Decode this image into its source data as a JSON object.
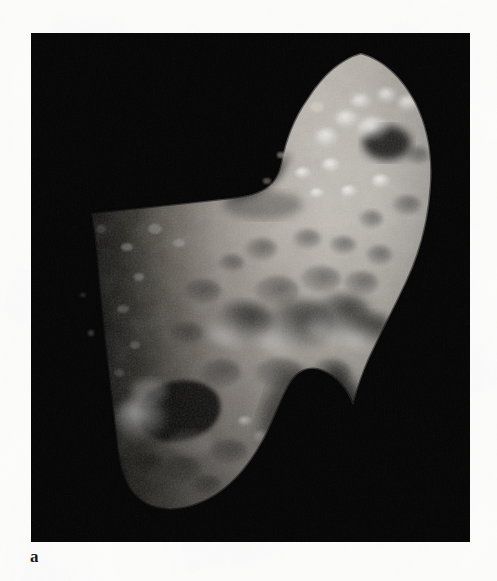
{
  "figure": {
    "panel_label": "a",
    "background_color": "#050505",
    "page_color": "#fbfbfa",
    "surface_color": "#b9b4ac",
    "shadow_color": "#000000",
    "highlight_color": "#e8e4dc",
    "panel": {
      "x": 31,
      "y": 33,
      "width": 439,
      "height": 509
    }
  },
  "image_content": {
    "type": "grayscale-photograph",
    "object": "irregular cratered asteroid",
    "illumination": "sunlit from the right, terminator along the left limb",
    "features": [
      "elongated upper-right lobe with bright crater rims near the terminator",
      "concave saddle notch in the upper middle of the silhouette",
      "broad cratered mid-body with several large shallow craters",
      "large shadow-filled crater at lower left with a bright western rim",
      "deep shadowed embayment along the lower-right edge",
      "tapering lower lobe ending near the bottom of the frame"
    ]
  }
}
